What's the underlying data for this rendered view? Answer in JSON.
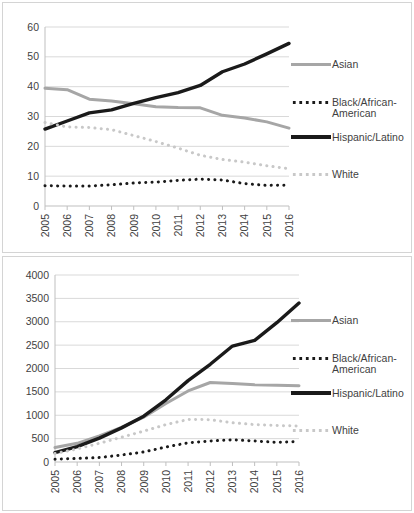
{
  "figure": {
    "panels": [
      "top",
      "bottom"
    ],
    "colors": {
      "asian": "#a6a6a6",
      "black": "#1a1a1a",
      "hispanic": "#1a1a1a",
      "white": "#c8c8c8",
      "gridline": "#d9d9d9",
      "axis": "#bfbfbf",
      "text": "#3f3f3f",
      "panel_border": "#d4d4d4"
    }
  },
  "legend": {
    "position": "right",
    "entries": [
      {
        "label": "Asian",
        "style": "solid-gray",
        "swatch": "asian-line-swatch"
      },
      {
        "label": "Black/African-\nAmerican",
        "style": "dotted-black",
        "swatch": "black-line-swatch"
      },
      {
        "label": "Hispanic/Latino",
        "style": "solid-black-thick",
        "swatch": "hispanic-line-swatch"
      },
      {
        "label": "White",
        "style": "dotted-light-gray",
        "swatch": "white-line-swatch"
      }
    ]
  },
  "chart_data": [
    {
      "id": "top-chart",
      "type": "line",
      "title": "",
      "xlabel": "",
      "ylabel": "",
      "grid": true,
      "legend_position": "right",
      "categories": [
        "2005",
        "2006",
        "2007",
        "2008",
        "2009",
        "2010",
        "2011",
        "2012",
        "2013",
        "2014",
        "2015",
        "2016"
      ],
      "x": [
        2005,
        2006,
        2007,
        2008,
        2009,
        2010,
        2011,
        2012,
        2013,
        2014,
        2015,
        2016
      ],
      "xlim": [
        2005,
        2016
      ],
      "ylim": [
        0,
        60
      ],
      "yticks": [
        0,
        10,
        20,
        30,
        40,
        50,
        60
      ],
      "series": [
        {
          "name": "Asian",
          "color": "#a6a6a6",
          "style": "solid",
          "values": [
            39.5,
            39.0,
            35.8,
            35.2,
            34.3,
            33.3,
            33.0,
            32.9,
            30.4,
            29.5,
            28.2,
            26.1
          ]
        },
        {
          "name": "Black/African-American",
          "color": "#1a1a1a",
          "style": "dotted",
          "values": [
            6.8,
            6.7,
            6.7,
            7.1,
            7.7,
            8.0,
            8.6,
            9.0,
            8.7,
            7.5,
            6.9,
            7.0
          ]
        },
        {
          "name": "Hispanic/Latino",
          "color": "#1a1a1a",
          "style": "solid-thick",
          "values": [
            25.8,
            28.5,
            31.2,
            32.2,
            34.4,
            36.3,
            38.0,
            40.4,
            45.0,
            47.6,
            51.0,
            54.5
          ]
        },
        {
          "name": "White",
          "color": "#c8c8c8",
          "style": "dotted",
          "values": [
            28.0,
            26.5,
            26.3,
            25.6,
            23.6,
            21.6,
            19.4,
            17.0,
            15.6,
            14.7,
            13.5,
            12.5
          ]
        }
      ]
    },
    {
      "id": "bottom-chart",
      "type": "line",
      "title": "",
      "xlabel": "",
      "ylabel": "",
      "grid": true,
      "legend_position": "right",
      "categories": [
        "2005",
        "2006",
        "2007",
        "2008",
        "2009",
        "2010",
        "2011",
        "2012",
        "2013",
        "2014",
        "2015",
        "2016"
      ],
      "x": [
        2005,
        2006,
        2007,
        2008,
        2009,
        2010,
        2011,
        2012,
        2013,
        2014,
        2015,
        2016
      ],
      "xlim": [
        2005,
        2016
      ],
      "ylim": [
        0,
        4000
      ],
      "yticks": [
        0,
        500,
        1000,
        1500,
        2000,
        2500,
        3000,
        3500,
        4000
      ],
      "series": [
        {
          "name": "Asian",
          "color": "#a6a6a6",
          "style": "solid",
          "values": [
            310,
            400,
            560,
            740,
            960,
            1250,
            1520,
            1700,
            1680,
            1650,
            1640,
            1630
          ]
        },
        {
          "name": "Black/African-American",
          "color": "#1a1a1a",
          "style": "dotted",
          "values": [
            60,
            75,
            95,
            150,
            215,
            320,
            410,
            450,
            475,
            450,
            420,
            440
          ]
        },
        {
          "name": "Hispanic/Latino",
          "color": "#1a1a1a",
          "style": "solid-thick",
          "values": [
            200,
            330,
            510,
            730,
            980,
            1330,
            1740,
            2090,
            2480,
            2600,
            2980,
            3400
          ]
        },
        {
          "name": "White",
          "color": "#c8c8c8",
          "style": "dotted",
          "values": [
            180,
            280,
            400,
            530,
            660,
            800,
            910,
            905,
            840,
            800,
            780,
            770
          ]
        }
      ]
    }
  ]
}
